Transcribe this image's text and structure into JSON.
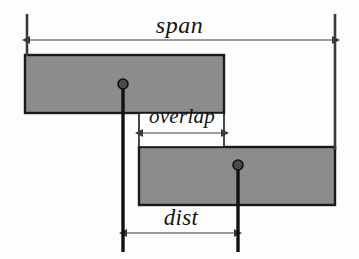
{
  "figure": {
    "width": 359,
    "height": 259,
    "background_color": "#fdfdfd"
  },
  "labels": {
    "span": "span",
    "overlap": "overlap",
    "dist": "dist"
  },
  "colors": {
    "bar_fill": "#8c8c8c",
    "bar_stroke": "#1a1a1a",
    "line": "#3a3a3a",
    "pointer": "#111111",
    "text": "#141414",
    "background": "#fdfdfd"
  },
  "geometry": {
    "bars": [
      {
        "name": "upper-interval",
        "x": 25,
        "y": 55,
        "width": 199,
        "height": 58
      },
      {
        "name": "lower-interval",
        "x": 139,
        "y": 147,
        "width": 196,
        "height": 58
      }
    ],
    "guides": [
      {
        "name": "left-guide",
        "x": 27,
        "y1": 14,
        "y2": 56
      },
      {
        "name": "right-guide",
        "x": 335,
        "y1": 14,
        "y2": 150
      }
    ],
    "measures": [
      {
        "name": "span",
        "y": 40,
        "x1": 27,
        "x2": 335
      },
      {
        "name": "overlap",
        "y": 133,
        "x1": 140,
        "x2": 224
      },
      {
        "name": "dist",
        "y": 233,
        "x1": 124,
        "x2": 237
      }
    ],
    "pointers": [
      {
        "name": "upper-midpoint-pointer",
        "x": 123,
        "dot_y": 84,
        "y2": 252
      },
      {
        "name": "lower-midpoint-pointer",
        "x": 238,
        "dot_y": 165,
        "y2": 252
      }
    ],
    "overlap_box": {
      "x": 139,
      "y": 113,
      "width": 85,
      "height": 34
    }
  }
}
